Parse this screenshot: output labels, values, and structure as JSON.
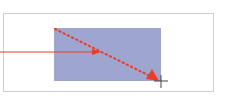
{
  "canvas": {
    "frame": {
      "border_color": "#cfcfcf",
      "background": "#ffffff"
    },
    "rectangle": {
      "fill": "#9ea6cf",
      "x": 54,
      "y": 28,
      "width": 107,
      "height": 53
    },
    "arrows": [
      {
        "id": "solid-arrow",
        "style": "solid",
        "color": "#f03a2a",
        "from": [
          0,
          52
        ],
        "to": [
          101,
          52
        ]
      },
      {
        "id": "dotted-arrow",
        "style": "dotted",
        "color": "#f03a2a",
        "from": [
          55,
          29
        ],
        "to": [
          158,
          80
        ]
      }
    ],
    "cursor": {
      "type": "crosshair",
      "x": 161,
      "y": 81,
      "color": "#444444"
    }
  }
}
